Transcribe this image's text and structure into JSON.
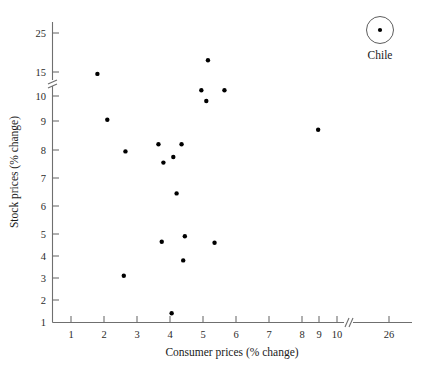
{
  "chart_data": {
    "type": "scatter",
    "title": "",
    "xlabel": "Consumer prices (% change)",
    "ylabel": "Stock prices (% change)",
    "grid": false,
    "legend": null,
    "xlim": [
      0.4,
      26.6
    ],
    "ylim": [
      1,
      26
    ],
    "x_ticks": [
      "1",
      "2",
      "3",
      "4",
      "5",
      "6",
      "7",
      "8",
      "9",
      "10",
      "26"
    ],
    "x_tick_values": [
      1,
      2,
      3,
      4,
      5,
      6,
      7,
      8,
      9,
      10,
      26
    ],
    "y_ticks": [
      "1",
      "2",
      "3",
      "4",
      "5",
      "6",
      "7",
      "8",
      "9",
      "10",
      "15",
      "25"
    ],
    "y_tick_values": [
      1,
      2,
      3,
      4,
      5,
      6,
      7,
      8,
      9,
      10,
      15,
      25
    ],
    "axis_breaks": {
      "x_break_between": [
        10,
        26
      ],
      "y_break_between": [
        10,
        15
      ]
    },
    "points": [
      {
        "x": 1.8,
        "y": 14.6
      },
      {
        "x": 2.1,
        "y": 9.05
      },
      {
        "x": 2.65,
        "y": 7.95
      },
      {
        "x": 2.6,
        "y": 3.1
      },
      {
        "x": 3.65,
        "y": 8.2
      },
      {
        "x": 3.8,
        "y": 7.55
      },
      {
        "x": 4.1,
        "y": 7.75
      },
      {
        "x": 4.35,
        "y": 8.2
      },
      {
        "x": 4.2,
        "y": 6.45
      },
      {
        "x": 3.75,
        "y": 4.65
      },
      {
        "x": 4.45,
        "y": 4.9
      },
      {
        "x": 4.4,
        "y": 3.8
      },
      {
        "x": 4.05,
        "y": 1.4
      },
      {
        "x": 4.95,
        "y": 11.2
      },
      {
        "x": 5.1,
        "y": 9.8
      },
      {
        "x": 5.15,
        "y": 18.0
      },
      {
        "x": 5.65,
        "y": 11.2
      },
      {
        "x": 5.35,
        "y": 4.6
      },
      {
        "x": 8.95,
        "y": 8.7
      }
    ],
    "annotations": [
      {
        "label": "Chile",
        "marker_x": 25.0,
        "marker_y": 25.0,
        "circled": true
      }
    ],
    "marker_color": "#000000",
    "axis_color": "#6f6f6f"
  }
}
